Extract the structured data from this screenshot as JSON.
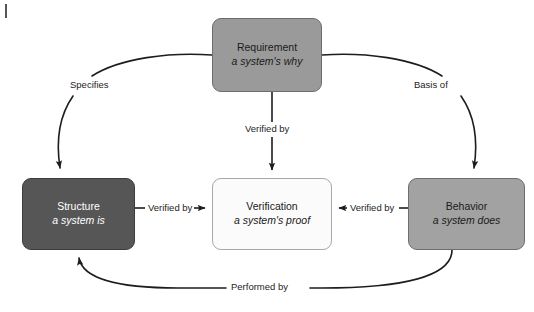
{
  "diagram": {
    "background_color": "#ffffff",
    "line_color": "#1d1d1d",
    "nodes": [
      {
        "id": "requirement",
        "title": "Requirement",
        "subtitle": "a system's why",
        "fill": "#9a9a9a",
        "text_color": "#1a1a1a",
        "border": "#6d6d6d",
        "x": 212,
        "y": 18,
        "w": 110,
        "h": 74
      },
      {
        "id": "structure",
        "title": "Structure",
        "subtitle": "a system is",
        "fill": "#565656",
        "text_color": "#ffffff",
        "border": "#3d3d3d",
        "x": 22,
        "y": 178,
        "w": 113,
        "h": 72
      },
      {
        "id": "verification",
        "title": "Verification",
        "subtitle": "a system's proof",
        "fill": "#fbfbfb",
        "text_color": "#1a1a1a",
        "border": "#a8a8a8",
        "x": 212,
        "y": 178,
        "w": 120,
        "h": 72
      },
      {
        "id": "behavior",
        "title": "Behavior",
        "subtitle": "a system does",
        "fill": "#a2a2a2",
        "text_color": "#1a1a1a",
        "border": "#6d6d6d",
        "x": 408,
        "y": 178,
        "w": 117,
        "h": 72
      }
    ],
    "edges": [
      {
        "id": "specifies",
        "label": "Specifies",
        "from": "requirement",
        "to": "structure",
        "label_x": 68,
        "label_y": 80
      },
      {
        "id": "basis-of",
        "label": "Basis of",
        "from": "requirement",
        "to": "behavior",
        "label_x": 412,
        "label_y": 80
      },
      {
        "id": "requirement-verified-by",
        "label": "Verified by",
        "from": "requirement",
        "to": "verification",
        "label_x": 243,
        "label_y": 129
      },
      {
        "id": "structure-verified-by",
        "label": "Verified by",
        "from": "structure",
        "to": "verification",
        "label_x": 146,
        "label_y": 200
      },
      {
        "id": "behavior-verified-by",
        "label": "Verified by",
        "from": "behavior",
        "to": "verification",
        "label_x": 348,
        "label_y": 200
      },
      {
        "id": "performed-by",
        "label": "Performed by",
        "from": "behavior",
        "to": "structure",
        "label_x": 236,
        "label_y": 275
      }
    ]
  }
}
